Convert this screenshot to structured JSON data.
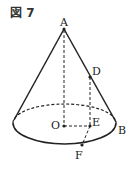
{
  "figure": {
    "title": "図 7",
    "labels": {
      "A": "A",
      "B": "B",
      "D": "D",
      "E": "E",
      "F": "F",
      "O": "O"
    },
    "colors": {
      "stroke": "#222222",
      "background": "#ffffff"
    }
  }
}
